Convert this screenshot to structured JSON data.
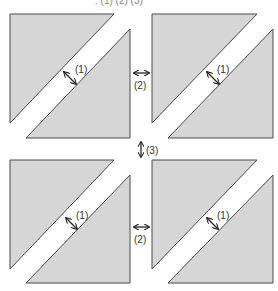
{
  "diagram": {
    "top_caption": ": (1) (2) (3)",
    "panels": [
      {
        "name": "top-left",
        "diagonal_gap_label": "(1)"
      },
      {
        "name": "top-right",
        "diagonal_gap_label": "(1)"
      },
      {
        "name": "bottom-left",
        "diagonal_gap_label": "(1)"
      },
      {
        "name": "bottom-right",
        "diagonal_gap_label": "(1)"
      }
    ],
    "horizontal_gap_labels": [
      "(2)",
      "(2)"
    ],
    "vertical_gap_label": "(3)",
    "colors": {
      "fill": "#d6d6d6",
      "stroke": "#4a4a4a",
      "arrow": "#222222"
    }
  }
}
